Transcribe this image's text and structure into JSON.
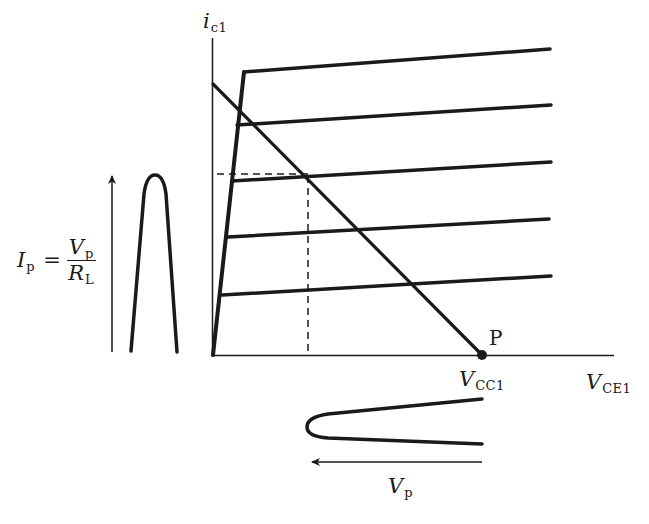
{
  "figure": {
    "type": "transistor output characteristics with load line",
    "axes": {
      "y_label": {
        "main": "i",
        "sub": "c1"
      },
      "x_label": {
        "main": "V",
        "sub": "CE1"
      }
    },
    "point_label": "P",
    "point_value_label": {
      "main": "V",
      "sub": "CC1"
    },
    "current_formula": {
      "lhs_main": "I",
      "lhs_sub": "p",
      "equals": "=",
      "num_main": "V",
      "num_sub": "p",
      "den_main": "R",
      "den_sub": "L"
    },
    "voltage_swing_label": {
      "main": "V",
      "sub": "p"
    },
    "characteristic_curve_count": 5,
    "colors": {
      "ink": "#1a1a1a",
      "background": "#ffffff"
    }
  }
}
